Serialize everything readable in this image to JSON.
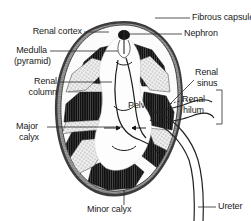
{
  "figure": {
    "background_color": "#ffffff",
    "ink_color": "#1a1a1a",
    "cortex_color": "#8f8f8f",
    "capsule_color": "#4a4a4a",
    "medulla_color": "#141414",
    "sinus_color": "#fdfdfd",
    "column_color": "#e8e8e8"
  },
  "labels": {
    "renal_cortex": "Renal cortex",
    "medulla_line1": "Medulla",
    "medulla_line2": "(pyramid)",
    "renal_column_line1": "Renal",
    "renal_column_line2": "column",
    "major_calyx_line1": "Major",
    "major_calyx_line2": "calyx",
    "minor_calyx": "Minor calyx",
    "fibrous_capsule": "Fibrous capsule",
    "nephron": "Nephron",
    "renal_sinus_line1": "Renal",
    "renal_sinus_line2": "sinus",
    "renal_hilum_line1": "Renal",
    "renal_hilum_line2": "hilum",
    "pelvis": "Pelvis",
    "ureter": "Ureter"
  }
}
